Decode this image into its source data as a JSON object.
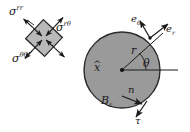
{
  "figure": {
    "background_color": "#ffffff",
    "ink_color": "#1a1a1a",
    "inclusion_fill": "#9a9a9a",
    "element_fill": "#b9b9b9"
  },
  "stress_element": {
    "name": "rotated-stress-element",
    "rotation_deg": 45,
    "labels": {
      "sigma_rr": {
        "base": "σ",
        "sup": "rr"
      },
      "sigma_rtheta": {
        "base": "σ",
        "sup": "rθ"
      },
      "sigma_thetatheta": {
        "base": "σ",
        "sup": "θθ"
      }
    }
  },
  "inclusion": {
    "name": "circular-inclusion",
    "body_label": {
      "base": "B",
      "sub": "ε"
    },
    "center_label": {
      "base": "x",
      "accent": "̂"
    },
    "radius_label": "r",
    "angle_label": "θ",
    "normal_label": "n",
    "traction_label": "τ",
    "basis_vectors": [
      {
        "base": "e",
        "sub": "θ"
      },
      {
        "base": "e",
        "sub": "r"
      }
    ]
  }
}
